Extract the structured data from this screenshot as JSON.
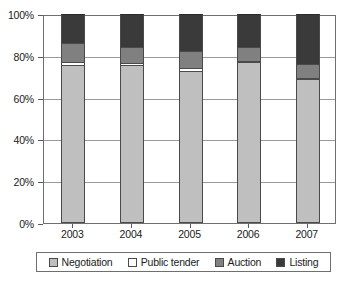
{
  "chart_data": {
    "type": "bar",
    "subtype": "stacked-100-percent",
    "title": "",
    "xlabel": "",
    "ylabel": "",
    "categories": [
      "2003",
      "2004",
      "2005",
      "2006",
      "2007"
    ],
    "ylim": [
      0,
      100
    ],
    "yticks": [
      0,
      20,
      40,
      60,
      80,
      100
    ],
    "ytick_labels": [
      "0%",
      "20%",
      "40%",
      "60%",
      "80%",
      "100%"
    ],
    "grid": true,
    "legend_position": "bottom",
    "series": [
      {
        "name": "Negotiation",
        "color": "#bfbfbf",
        "values": [
          75.5,
          75.5,
          72.5,
          77.0,
          69.0
        ]
      },
      {
        "name": "Public tender",
        "color": "#ffffff",
        "values": [
          1.5,
          1.0,
          1.5,
          0.5,
          0.5
        ]
      },
      {
        "name": "Auction",
        "color": "#808080",
        "values": [
          9.0,
          7.5,
          8.5,
          6.5,
          6.5
        ]
      },
      {
        "name": "Listing",
        "color": "#3a3a3a",
        "values": [
          14.0,
          16.0,
          17.5,
          16.0,
          24.0
        ]
      }
    ]
  },
  "axis": {
    "y_tick_labels": [
      "100%",
      "80%",
      "60%",
      "40%",
      "20%",
      "0%"
    ],
    "x_tick_labels": [
      "2003",
      "2004",
      "2005",
      "2006",
      "2007"
    ]
  },
  "legend": {
    "items": [
      {
        "label": "Negotiation",
        "color": "#bfbfbf"
      },
      {
        "label": "Public tender",
        "color": "#ffffff"
      },
      {
        "label": "Auction",
        "color": "#808080"
      },
      {
        "label": "Listing",
        "color": "#3a3a3a"
      }
    ]
  },
  "colors": {
    "negotiation": "#bfbfbf",
    "public_tender": "#ffffff",
    "auction": "#808080",
    "listing": "#3a3a3a",
    "frame": "#6f6f6f",
    "gridline": "#9a9a9a",
    "text": "#1a1a1a",
    "background": "#ffffff"
  }
}
